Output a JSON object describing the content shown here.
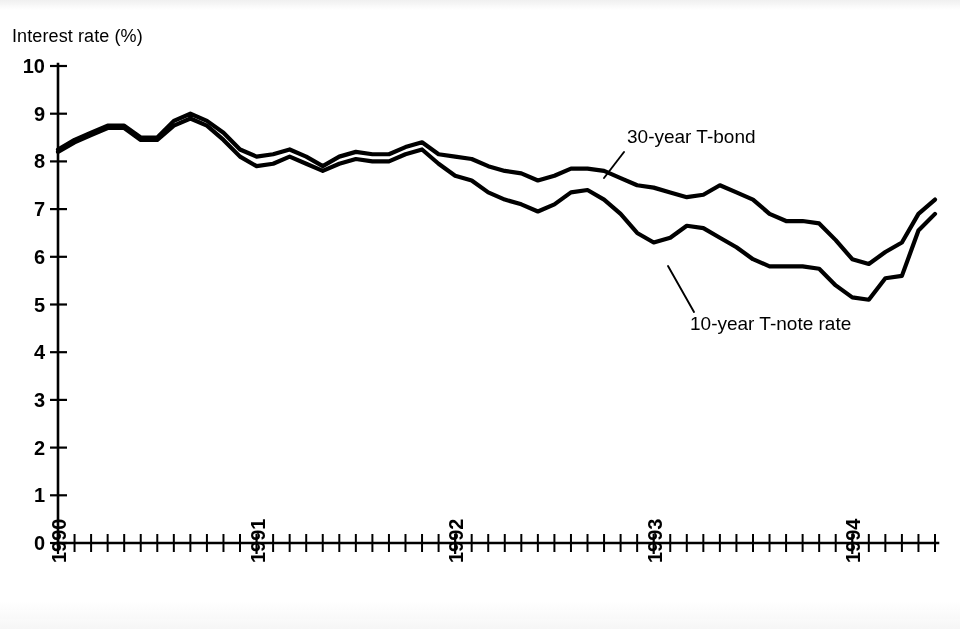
{
  "chart_data": {
    "type": "line",
    "title": "Interest rate (%)",
    "xlabel": "",
    "ylabel": "Interest rate (%)",
    "ylim": [
      0,
      10
    ],
    "ytick_labels": [
      "0",
      "1",
      "2",
      "3",
      "4",
      "5",
      "6",
      "7",
      "8",
      "9",
      "10"
    ],
    "yticks": [
      0,
      1,
      2,
      3,
      4,
      5,
      6,
      7,
      8,
      9,
      10
    ],
    "grid": false,
    "legend_position": "inline-annotation",
    "x_axis_type": "monthly",
    "x_tick_labels": [
      "1990",
      "1991",
      "1992",
      "1993",
      "1994"
    ],
    "x_label_positions": [
      0,
      12,
      24,
      36,
      48
    ],
    "x_range_months": [
      0,
      53
    ],
    "x": [
      0,
      1,
      2,
      3,
      4,
      5,
      6,
      7,
      8,
      9,
      10,
      11,
      12,
      13,
      14,
      15,
      16,
      17,
      18,
      19,
      20,
      21,
      22,
      23,
      24,
      25,
      26,
      27,
      28,
      29,
      30,
      31,
      32,
      33,
      34,
      35,
      36,
      37,
      38,
      39,
      40,
      41,
      42,
      43,
      44,
      45,
      46,
      47,
      48,
      49,
      50,
      51,
      52,
      53
    ],
    "series": [
      {
        "name": "30-year T-bond",
        "values": [
          8.25,
          8.45,
          8.6,
          8.75,
          8.75,
          8.5,
          8.5,
          8.85,
          9.0,
          8.85,
          8.6,
          8.25,
          8.1,
          8.15,
          8.25,
          8.1,
          7.9,
          8.1,
          8.2,
          8.15,
          8.15,
          8.3,
          8.4,
          8.15,
          8.1,
          8.05,
          7.9,
          7.8,
          7.75,
          7.6,
          7.7,
          7.85,
          7.85,
          7.8,
          7.65,
          7.5,
          7.45,
          7.35,
          7.25,
          7.3,
          7.5,
          7.35,
          7.2,
          6.9,
          6.75,
          6.75,
          6.7,
          6.35,
          5.95,
          5.85,
          6.1,
          6.3,
          6.9,
          7.2
        ]
      },
      {
        "name": "10-year T-note rate",
        "values": [
          8.2,
          8.4,
          8.55,
          8.7,
          8.7,
          8.45,
          8.45,
          8.75,
          8.9,
          8.75,
          8.45,
          8.1,
          7.9,
          7.95,
          8.1,
          7.95,
          7.8,
          7.95,
          8.05,
          8.0,
          8.0,
          8.15,
          8.25,
          7.95,
          7.7,
          7.6,
          7.35,
          7.2,
          7.1,
          6.95,
          7.1,
          7.35,
          7.4,
          7.2,
          6.9,
          6.5,
          6.3,
          6.4,
          6.65,
          6.6,
          6.4,
          6.2,
          5.95,
          5.8,
          5.8,
          5.8,
          5.75,
          5.4,
          5.15,
          5.1,
          5.55,
          5.6,
          6.55,
          6.9
        ]
      }
    ],
    "annotations": [
      {
        "text": "30-year T-bond",
        "target_series": "30-year T-bond",
        "label_x": 627,
        "label_y": 143
      },
      {
        "text": "10-year T-note rate",
        "target_series": "10-year T-note rate",
        "label_x": 690,
        "label_y": 330
      }
    ],
    "colors": {
      "line": "#000000",
      "axis": "#000000",
      "background": "#ffffff"
    }
  }
}
